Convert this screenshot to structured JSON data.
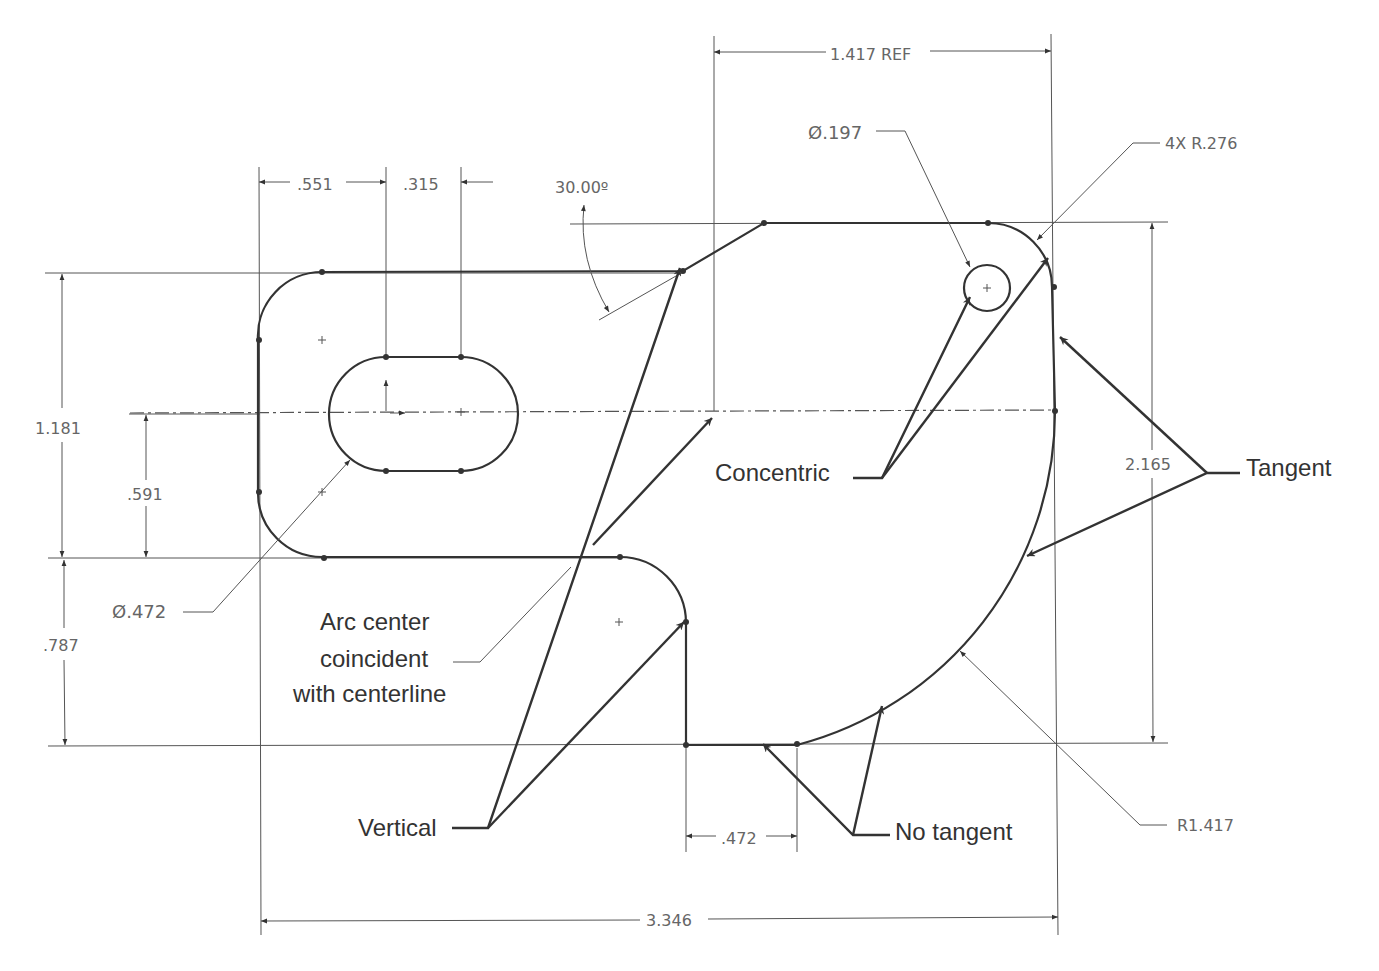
{
  "dimensions": {
    "ref_1417": "1.417 REF",
    "d551": ".551",
    "d315": ".315",
    "angle": "30.00º",
    "dia197": "Ø.197",
    "r276": "4X R.276",
    "d1181": "1.181",
    "d591": ".591",
    "d787": ".787",
    "dia472": "Ø.472",
    "d2165": "2.165",
    "d472": ".472",
    "d3346": "3.346",
    "r1417": "R1.417"
  },
  "annotations": {
    "concentric": "Concentric",
    "tangent": "Tangent",
    "arc_center_1": "Arc center",
    "arc_center_2": "coincident",
    "arc_center_3": "with centerline",
    "vertical": "Vertical",
    "no_tangent": "No tangent"
  },
  "colors": {
    "geometry": "#333333",
    "dimension_text": "#666666",
    "background": "#ffffff"
  }
}
